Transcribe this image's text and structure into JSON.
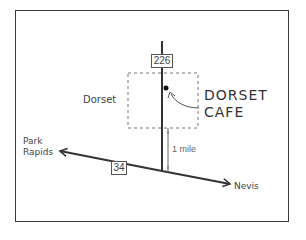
{
  "map": {
    "route_north": "226",
    "route_east_west": "34",
    "town_label": "Dorset",
    "destination_label_line1": "DORSET",
    "destination_label_line2": "CAFE",
    "west_destination_line1": "Park",
    "west_destination_line2": "Rapids",
    "east_destination": "Nevis",
    "distance_label": "1 mile"
  }
}
